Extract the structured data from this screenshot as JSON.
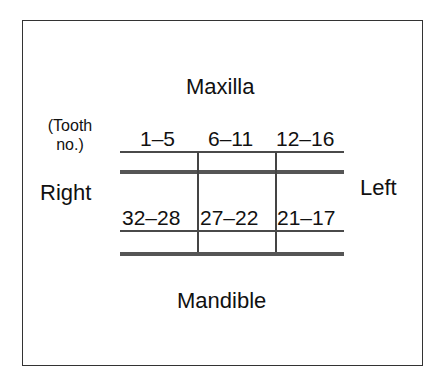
{
  "diagram": {
    "title_top": "Maxilla",
    "title_bottom": "Mandible",
    "side_right": "Right",
    "side_left": "Left",
    "tooth_note_line1": "(Tooth",
    "tooth_note_line2": "no.)",
    "maxilla_ranges": [
      "1–5",
      "6–11",
      "12–16"
    ],
    "mandible_ranges": [
      "32–28",
      "27–22",
      "21–17"
    ],
    "colors": {
      "line": "#4a4a4a",
      "text": "#111111",
      "border": "#333333",
      "background": "#ffffff"
    }
  }
}
